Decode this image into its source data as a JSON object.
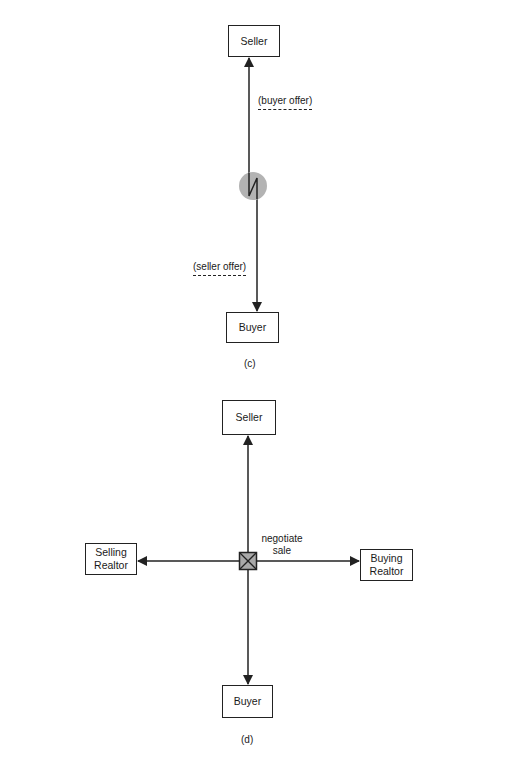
{
  "diagram_c": {
    "caption": "(c)",
    "nodes": {
      "seller": "Seller",
      "buyer": "Buyer"
    },
    "labels": {
      "buyer_offer": "(buyer offer)",
      "seller_offer": "(seller offer)"
    },
    "connector": "grey-circle-with-zigzag (negotiation exchange)"
  },
  "diagram_d": {
    "caption": "(d)",
    "nodes": {
      "seller": "Seller",
      "buyer": "Buyer",
      "selling_realtor": "Selling Realtor",
      "buying_realtor": "Buying Realtor"
    },
    "labels": {
      "center": "negotiate sale"
    },
    "connector": "grey-square-with-x (hub)"
  },
  "colors": {
    "line": "#222222",
    "connector_fill": "#a9a9a9"
  }
}
